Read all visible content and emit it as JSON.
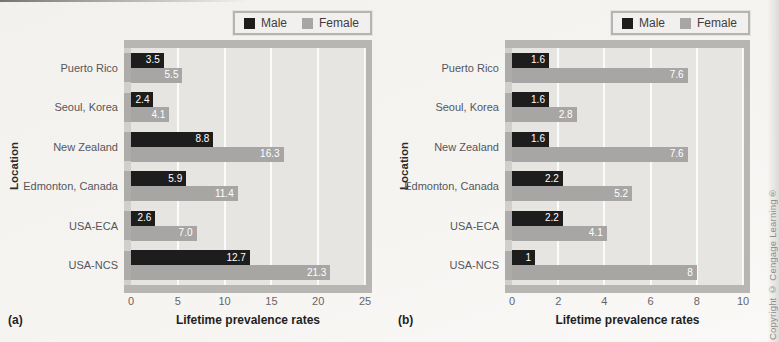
{
  "page": {
    "copyright": "Copyright © Cengage Learning®",
    "background": "#f3f2ef"
  },
  "colors": {
    "male": "#1d1d1d",
    "female": "#a7a6a4",
    "plot_background": "#e6e5e2",
    "plot_frame": "#b7b6b3",
    "gridline": "#ffffff"
  },
  "chart_data": [
    {
      "type": "bar",
      "orientation": "horizontal",
      "panel_label": "(a)",
      "title": "",
      "xlabel": "Lifetime prevalence rates",
      "ylabel": "Location",
      "xlim": [
        0,
        25
      ],
      "xticks": [
        "0",
        "5",
        "10",
        "15",
        "20",
        "25"
      ],
      "xtick_values": [
        0,
        5,
        10,
        15,
        20,
        25
      ],
      "grid": true,
      "legend": {
        "position": "top-right",
        "entries": [
          "Male",
          "Female"
        ]
      },
      "categories": [
        "Puerto Rico",
        "Seoul, Korea",
        "New Zealand",
        "Edmonton, Canada",
        "USA-ECA",
        "USA-NCS"
      ],
      "series": [
        {
          "name": "Male",
          "color": "#1d1d1d",
          "values": [
            3.5,
            2.4,
            8.8,
            5.9,
            2.6,
            12.7
          ],
          "labels": [
            "3.5",
            "2.4",
            "8.8",
            "5.9",
            "2.6",
            "12.7"
          ]
        },
        {
          "name": "Female",
          "color": "#a7a6a4",
          "values": [
            5.5,
            4.1,
            16.3,
            11.4,
            7.0,
            21.3
          ],
          "labels": [
            "5.5",
            "4.1",
            "16.3",
            "11.4",
            "7.0",
            "21.3"
          ]
        }
      ]
    },
    {
      "type": "bar",
      "orientation": "horizontal",
      "panel_label": "(b)",
      "title": "",
      "xlabel": "Lifetime prevalence rates",
      "ylabel": "Location",
      "xlim": [
        0,
        10
      ],
      "xticks": [
        "0",
        "2",
        "4",
        "6",
        "8",
        "10"
      ],
      "xtick_values": [
        0,
        2,
        4,
        6,
        8,
        10
      ],
      "grid": true,
      "legend": {
        "position": "top-right",
        "entries": [
          "Male",
          "Female"
        ]
      },
      "categories": [
        "Puerto Rico",
        "Seoul, Korea",
        "New Zealand",
        "Edmonton, Canada",
        "USA-ECA",
        "USA-NCS"
      ],
      "series": [
        {
          "name": "Male",
          "color": "#1d1d1d",
          "values": [
            1.6,
            1.6,
            1.6,
            2.2,
            2.2,
            1
          ],
          "labels": [
            "1.6",
            "1.6",
            "1.6",
            "2.2",
            "2.2",
            "1"
          ]
        },
        {
          "name": "Female",
          "color": "#a7a6a4",
          "values": [
            7.6,
            2.8,
            7.6,
            5.2,
            4.1,
            8
          ],
          "labels": [
            "7.6",
            "2.8",
            "7.6",
            "5.2",
            "4.1",
            "8"
          ]
        }
      ]
    }
  ]
}
